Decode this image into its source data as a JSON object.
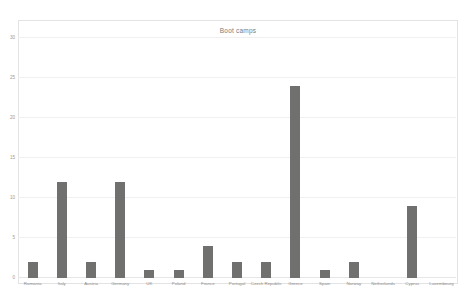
{
  "chart_data": {
    "type": "bar",
    "title": "Boot camps",
    "xlabel": "",
    "ylabel": "",
    "ylim": [
      0,
      30
    ],
    "yticks": [
      0,
      5,
      10,
      15,
      20,
      25,
      30
    ],
    "grid": true,
    "legend": "none",
    "bar_color": "#70706f",
    "categories": [
      "Romania",
      "Italy",
      "Austria",
      "Germany",
      "UK",
      "Poland",
      "France",
      "Portugal",
      "Czech Republic",
      "Greece",
      "Spain",
      "Norway",
      "Netherlands",
      "Cyprus",
      "Luxembourg"
    ],
    "values": [
      2,
      12,
      2,
      12,
      1,
      1,
      4,
      2,
      2,
      24,
      1,
      2,
      0,
      9,
      0
    ]
  }
}
